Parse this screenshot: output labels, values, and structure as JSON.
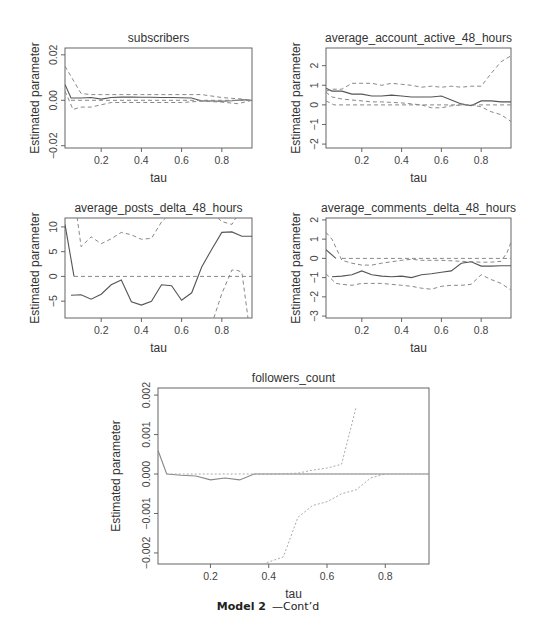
{
  "caption": {
    "bold": "Model 2",
    "rest": "—Cont’d"
  },
  "chart_data": [
    {
      "type": "line",
      "title": "subscribers",
      "xlabel": "tau",
      "ylabel": "Estimated parameter",
      "xlim": [
        0.02,
        0.95
      ],
      "ylim": [
        -0.021,
        0.023
      ],
      "xticks": [
        0.2,
        0.4,
        0.6,
        0.8
      ],
      "xtick_labels": [
        "0.2",
        "0.4",
        "0.6",
        "0.8"
      ],
      "yticks": [
        -0.02,
        0.0,
        0.02
      ],
      "ytick_labels": [
        "-0.02",
        "0.00",
        "0.02"
      ],
      "box": {
        "x0": 65,
        "x1": 252,
        "y0": 48,
        "y1": 148
      },
      "series": [
        {
          "name": "estimate",
          "style": "solid",
          "x": [
            0.02,
            0.05,
            0.1,
            0.15,
            0.2,
            0.25,
            0.3,
            0.35,
            0.4,
            0.45,
            0.5,
            0.55,
            0.6,
            0.65,
            0.7,
            0.75,
            0.8,
            0.85,
            0.9,
            0.95
          ],
          "y": [
            0.007,
            0.001,
            0.001,
            0.0012,
            0.0005,
            0.0012,
            0.0014,
            0.0014,
            0.0013,
            0.0013,
            0.0012,
            0.0012,
            0.0011,
            0.001,
            -0.0003,
            -0.0003,
            -0.0004,
            -0.0002,
            0.0002,
            0.0
          ]
        },
        {
          "name": "upper-ci",
          "style": "dashed",
          "x": [
            0.02,
            0.1,
            0.15,
            0.2,
            0.3,
            0.4,
            0.5,
            0.6,
            0.7,
            0.8,
            0.9,
            0.95
          ],
          "y": [
            0.015,
            0.003,
            0.0025,
            0.0025,
            0.0025,
            0.0025,
            0.0025,
            0.0025,
            0.0025,
            0.0012,
            0.0005,
            0.0
          ]
        },
        {
          "name": "lower-ci",
          "style": "dashed",
          "x": [
            0.02,
            0.06,
            0.1,
            0.15,
            0.2,
            0.25,
            0.4,
            0.6,
            0.7,
            0.8,
            0.88,
            0.95
          ],
          "y": [
            0.004,
            -0.004,
            -0.003,
            -0.003,
            -0.002,
            -0.001,
            -0.001,
            -0.001,
            -0.0004,
            -0.0008,
            -0.0015,
            0.0
          ]
        },
        {
          "name": "zero",
          "style": "dashed",
          "x": [
            0.05,
            0.95
          ],
          "y": [
            0.0,
            0.0
          ]
        }
      ]
    },
    {
      "type": "line",
      "title": "average_account_active_48_hours",
      "xlabel": "tau",
      "ylabel": "Estimated parameter",
      "xlim": [
        0.02,
        0.95
      ],
      "ylim": [
        -2.2,
        2.9
      ],
      "xticks": [
        0.2,
        0.4,
        0.6,
        0.8
      ],
      "xtick_labels": [
        "0.2",
        "0.4",
        "0.6",
        "0.8"
      ],
      "yticks": [
        -2,
        -1,
        0,
        1,
        2
      ],
      "ytick_labels": [
        "-2",
        "-1",
        "0",
        "1",
        "2"
      ],
      "box": {
        "x0": 326,
        "x1": 511,
        "y0": 48,
        "y1": 148
      },
      "series": [
        {
          "name": "estimate",
          "style": "solid",
          "x": [
            0.02,
            0.05,
            0.1,
            0.15,
            0.2,
            0.25,
            0.3,
            0.35,
            0.4,
            0.45,
            0.5,
            0.55,
            0.6,
            0.65,
            0.7,
            0.75,
            0.8,
            0.85,
            0.9,
            0.95
          ],
          "y": [
            0.85,
            0.7,
            0.7,
            0.55,
            0.55,
            0.45,
            0.45,
            0.5,
            0.45,
            0.4,
            0.4,
            0.4,
            0.45,
            0.25,
            0.05,
            -0.05,
            0.2,
            0.2,
            0.15,
            0.15
          ]
        },
        {
          "name": "upper-ci",
          "style": "dashed",
          "x": [
            0.02,
            0.05,
            0.1,
            0.15,
            0.2,
            0.25,
            0.3,
            0.35,
            0.4,
            0.45,
            0.5,
            0.55,
            0.6,
            0.65,
            0.7,
            0.75,
            0.8,
            0.85,
            0.9,
            0.95
          ],
          "y": [
            0.7,
            0.8,
            0.8,
            1.1,
            1.1,
            1.1,
            1.0,
            1.1,
            1.05,
            1.0,
            0.9,
            0.95,
            0.9,
            0.95,
            0.9,
            0.95,
            0.95,
            1.6,
            2.2,
            2.5
          ]
        },
        {
          "name": "lower-ci",
          "style": "dashed",
          "x": [
            0.02,
            0.05,
            0.1,
            0.15,
            0.2,
            0.25,
            0.3,
            0.4,
            0.5,
            0.55,
            0.6,
            0.65,
            0.7,
            0.75,
            0.8,
            0.85,
            0.9,
            0.95
          ],
          "y": [
            0.65,
            0.4,
            0.3,
            0.25,
            0.2,
            0.15,
            0.15,
            0.1,
            0.0,
            -0.15,
            -0.15,
            -0.05,
            0.0,
            0.0,
            -0.1,
            -0.35,
            -0.5,
            -0.85
          ]
        },
        {
          "name": "zero",
          "style": "dashed",
          "x": [
            0.02,
            0.06,
            0.95
          ],
          "y": [
            0.2,
            0.0,
            0.0
          ]
        }
      ]
    },
    {
      "type": "line",
      "title": "average_posts_delta_48_hours",
      "xlabel": "tau",
      "ylabel": "Estimated parameter",
      "xlim": [
        0.02,
        0.95
      ],
      "ylim": [
        -8.4,
        11.8
      ],
      "xticks": [
        0.2,
        0.4,
        0.6,
        0.8
      ],
      "xtick_labels": [
        "0.2",
        "0.4",
        "0.6",
        "0.8"
      ],
      "yticks": [
        -5,
        0,
        5,
        10
      ],
      "ytick_labels": [
        "-5",
        "0",
        "5",
        "10"
      ],
      "box": {
        "x0": 65,
        "x1": 252,
        "y0": 218,
        "y1": 318
      },
      "series": [
        {
          "name": "estimate-start",
          "style": "solid",
          "x": [
            0.02,
            0.065
          ],
          "y": [
            10.5,
            0.0
          ]
        },
        {
          "name": "estimate",
          "style": "solid",
          "x": [
            0.05,
            0.1,
            0.15,
            0.2,
            0.25,
            0.3,
            0.35,
            0.4,
            0.45,
            0.5,
            0.55,
            0.6,
            0.65,
            0.7,
            0.75,
            0.8,
            0.85,
            0.9,
            0.95
          ],
          "y": [
            -3.8,
            -3.7,
            -4.6,
            -3.6,
            -1.7,
            -0.7,
            -5.1,
            -5.8,
            -5.0,
            -1.7,
            -1.9,
            -4.8,
            -3.3,
            1.9,
            5.5,
            8.9,
            9.0,
            8.1,
            8.1
          ]
        },
        {
          "name": "upper-ci",
          "style": "dashed",
          "x": [
            0.08,
            0.1,
            0.15,
            0.2,
            0.25,
            0.3,
            0.35,
            0.4,
            0.45,
            0.5,
            0.52
          ],
          "y": [
            12,
            6.0,
            8.0,
            6.6,
            7.6,
            8.9,
            8.4,
            7.5,
            7.7,
            11.0,
            11.8
          ]
        },
        {
          "name": "upper-ci-right",
          "style": "dashed",
          "x": [
            0.78,
            0.8,
            0.85,
            0.87
          ],
          "y": [
            11.8,
            11.1,
            10.5,
            11.8
          ]
        },
        {
          "name": "lower-ci-right",
          "style": "dashed",
          "x": [
            0.76,
            0.8,
            0.85,
            0.88,
            0.9,
            0.93
          ],
          "y": [
            -8.4,
            -3.5,
            1.3,
            1.2,
            0.8,
            -8.4
          ]
        },
        {
          "name": "zero",
          "style": "dashed",
          "x": [
            0.065,
            0.95
          ],
          "y": [
            0.0,
            0.0
          ]
        }
      ]
    },
    {
      "type": "line",
      "title": "average_comments_delta_48_hours",
      "xlabel": "tau",
      "ylabel": "Estimated parameter",
      "xlim": [
        0.02,
        0.95
      ],
      "ylim": [
        -3.1,
        2.1
      ],
      "xticks": [
        0.2,
        0.4,
        0.6,
        0.8
      ],
      "xtick_labels": [
        "0.2",
        "0.4",
        "0.6",
        "0.8"
      ],
      "yticks": [
        -3,
        -2,
        -1,
        0,
        1,
        2
      ],
      "ytick_labels": [
        "-3",
        "-2",
        "-1",
        "0",
        "1",
        "2"
      ],
      "box": {
        "x0": 326,
        "x1": 511,
        "y0": 218,
        "y1": 318
      },
      "series": [
        {
          "name": "estimate-start",
          "style": "solid",
          "x": [
            0.02,
            0.07
          ],
          "y": [
            0.45,
            0.0
          ]
        },
        {
          "name": "estimate",
          "style": "solid",
          "x": [
            0.05,
            0.1,
            0.15,
            0.2,
            0.25,
            0.3,
            0.35,
            0.4,
            0.45,
            0.5,
            0.55,
            0.6,
            0.65,
            0.7,
            0.75,
            0.8,
            0.85,
            0.9,
            0.95
          ],
          "y": [
            -0.95,
            -0.92,
            -0.85,
            -0.65,
            -0.85,
            -0.92,
            -0.95,
            -0.92,
            -1.0,
            -0.85,
            -0.8,
            -0.72,
            -0.65,
            -0.25,
            -0.18,
            -0.4,
            -0.4,
            -0.38,
            -0.38
          ]
        },
        {
          "name": "upper-ci",
          "style": "dashed",
          "x": [
            0.02,
            0.05,
            0.1,
            0.15,
            0.2,
            0.25,
            0.3,
            0.4,
            0.45,
            0.5,
            0.6,
            0.7,
            0.8,
            0.85,
            0.9,
            0.93,
            0.95
          ],
          "y": [
            1.35,
            1.0,
            -0.1,
            -0.25,
            -0.35,
            -0.35,
            -0.25,
            -0.1,
            -0.05,
            -0.1,
            -0.1,
            -0.15,
            -0.2,
            -0.2,
            -0.15,
            0.3,
            0.85
          ]
        },
        {
          "name": "lower-ci",
          "style": "dashed",
          "x": [
            0.02,
            0.07,
            0.1,
            0.15,
            0.2,
            0.25,
            0.3,
            0.4,
            0.45,
            0.5,
            0.55,
            0.6,
            0.65,
            0.7,
            0.75,
            0.8,
            0.85,
            0.9,
            0.95
          ],
          "y": [
            -0.8,
            -1.3,
            -1.35,
            -1.4,
            -1.3,
            -1.3,
            -1.3,
            -1.4,
            -1.45,
            -1.55,
            -1.6,
            -1.45,
            -1.4,
            -1.4,
            -1.35,
            -0.85,
            -1.1,
            -1.3,
            -1.65
          ]
        },
        {
          "name": "zero",
          "style": "dashed",
          "x": [
            0.1,
            0.95
          ],
          "y": [
            0.0,
            0.0
          ]
        }
      ]
    },
    {
      "type": "line",
      "title": "followers_count",
      "xlabel": "tau",
      "ylabel": "Estimated parameter",
      "xlim": [
        0.02,
        0.95
      ],
      "ylim": [
        -0.00228,
        0.00218
      ],
      "xticks": [
        0.2,
        0.4,
        0.6,
        0.8
      ],
      "xtick_labels": [
        "0.2",
        "0.4",
        "0.6",
        "0.8"
      ],
      "yticks": [
        -0.002,
        -0.001,
        0.0,
        0.001,
        0.002
      ],
      "ytick_labels": [
        "-0.002",
        "-0.001",
        "0.000",
        "0.001",
        "0.002"
      ],
      "box": {
        "x0": 158,
        "x1": 429,
        "y0": 388,
        "y1": 564
      },
      "series": [
        {
          "name": "estimate",
          "style": "solid",
          "x": [
            0.02,
            0.05,
            0.1,
            0.15,
            0.2,
            0.25,
            0.3,
            0.35,
            0.4,
            0.5,
            0.6,
            0.7,
            0.8,
            0.9,
            0.95
          ],
          "y": [
            0.0006,
            0.0,
            -3e-05,
            -5e-05,
            -0.00015,
            -0.0001,
            -0.00015,
            0.0,
            0.0,
            0.0,
            0.0,
            0.0,
            0.0,
            0.0,
            0.0
          ]
        },
        {
          "name": "upper-ci",
          "style": "dashed",
          "x": [
            0.35,
            0.4,
            0.5,
            0.55,
            0.6,
            0.65,
            0.7
          ],
          "y": [
            0.0,
            0.0,
            2e-05,
            0.0001,
            0.00015,
            0.00025,
            0.0017
          ]
        },
        {
          "name": "lower-ci",
          "style": "dashed",
          "x": [
            0.38,
            0.45,
            0.5,
            0.55,
            0.6,
            0.65,
            0.7,
            0.75,
            0.8
          ],
          "y": [
            -0.00228,
            -0.0021,
            -0.0011,
            -0.0008,
            -0.0007,
            -0.0005,
            -0.0004,
            -0.0001,
            0.0
          ]
        },
        {
          "name": "zero",
          "style": "dashed",
          "x": [
            0.05,
            0.95
          ],
          "y": [
            0.0,
            0.0
          ]
        }
      ]
    }
  ]
}
